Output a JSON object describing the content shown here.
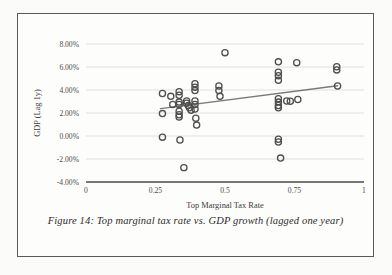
{
  "figure": {
    "caption": "Figure 14: Top marginal tax rate vs. GDP growth (lagged one year)",
    "background_color": "#fdfdfb",
    "border_color": "#5a5a5a"
  },
  "chart_data": {
    "type": "scatter",
    "title": "",
    "xlabel": "Top Marginal Tax Rate",
    "ylabel": "GDP (Lag 1y)",
    "xlim": [
      0,
      1
    ],
    "ylim": [
      -0.04,
      0.08
    ],
    "xticks": [
      "0",
      "0.25",
      "0.5",
      "0.75",
      "1"
    ],
    "xtick_values": [
      0,
      0.25,
      0.5,
      0.75,
      1
    ],
    "yticks": [
      "8.00%",
      "6.00%",
      "4.00%",
      "2.00%",
      "0.00%",
      "-2.00%",
      "-4.00%"
    ],
    "ytick_values": [
      0.08,
      0.06,
      0.04,
      0.02,
      0.0,
      -0.02,
      -0.04
    ],
    "grid": true,
    "grid_color": "#d8d8d8",
    "legend": null,
    "marker": {
      "style": "open-circle",
      "edge_color": "#4f4f4f",
      "fill": "none",
      "radius": 3.1,
      "stroke_width": 1.3
    },
    "points": [
      {
        "x": 0.275,
        "y": 0.037
      },
      {
        "x": 0.275,
        "y": 0.0195
      },
      {
        "x": 0.275,
        "y": -0.001
      },
      {
        "x": 0.305,
        "y": 0.0345
      },
      {
        "x": 0.312,
        "y": 0.0275
      },
      {
        "x": 0.335,
        "y": 0.0385
      },
      {
        "x": 0.335,
        "y": 0.0355
      },
      {
        "x": 0.335,
        "y": 0.0295
      },
      {
        "x": 0.335,
        "y": 0.0275
      },
      {
        "x": 0.335,
        "y": 0.0215
      },
      {
        "x": 0.335,
        "y": 0.0185
      },
      {
        "x": 0.335,
        "y": 0.0165
      },
      {
        "x": 0.338,
        "y": -0.0035
      },
      {
        "x": 0.352,
        "y": -0.0275
      },
      {
        "x": 0.362,
        "y": 0.0305
      },
      {
        "x": 0.362,
        "y": 0.0285
      },
      {
        "x": 0.368,
        "y": 0.0265
      },
      {
        "x": 0.372,
        "y": 0.0245
      },
      {
        "x": 0.378,
        "y": 0.0225
      },
      {
        "x": 0.392,
        "y": 0.0455
      },
      {
        "x": 0.392,
        "y": 0.0425
      },
      {
        "x": 0.392,
        "y": 0.0395
      },
      {
        "x": 0.392,
        "y": 0.0305
      },
      {
        "x": 0.392,
        "y": 0.0275
      },
      {
        "x": 0.392,
        "y": 0.0235
      },
      {
        "x": 0.395,
        "y": 0.0155
      },
      {
        "x": 0.398,
        "y": 0.0095
      },
      {
        "x": 0.478,
        "y": 0.0435
      },
      {
        "x": 0.478,
        "y": 0.0395
      },
      {
        "x": 0.482,
        "y": 0.0345
      },
      {
        "x": 0.5,
        "y": 0.0725
      },
      {
        "x": 0.692,
        "y": 0.0645
      },
      {
        "x": 0.692,
        "y": 0.0555
      },
      {
        "x": 0.692,
        "y": 0.0525
      },
      {
        "x": 0.692,
        "y": 0.0485
      },
      {
        "x": 0.692,
        "y": 0.0325
      },
      {
        "x": 0.692,
        "y": 0.0295
      },
      {
        "x": 0.692,
        "y": 0.0265
      },
      {
        "x": 0.692,
        "y": 0.0245
      },
      {
        "x": 0.692,
        "y": -0.0028
      },
      {
        "x": 0.692,
        "y": -0.0052
      },
      {
        "x": 0.7,
        "y": -0.0192
      },
      {
        "x": 0.722,
        "y": 0.0305
      },
      {
        "x": 0.735,
        "y": 0.0302
      },
      {
        "x": 0.758,
        "y": 0.0638
      },
      {
        "x": 0.762,
        "y": 0.0318
      },
      {
        "x": 0.902,
        "y": 0.0602
      },
      {
        "x": 0.902,
        "y": 0.0575
      },
      {
        "x": 0.905,
        "y": 0.0435
      }
    ],
    "trendline": {
      "type": "linear",
      "color": "#7a7a7a",
      "width": 1.5,
      "x_start": 0.268,
      "y_start": 0.0238,
      "x_end": 0.905,
      "y_end": 0.0437
    }
  }
}
